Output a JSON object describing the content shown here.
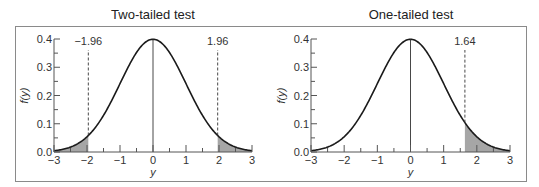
{
  "chart_data": [
    {
      "type": "area",
      "title": "Two-tailed test",
      "xlabel": "y",
      "ylabel": "f(y)",
      "xlim": [
        -3,
        3
      ],
      "ylim": [
        0,
        0.4
      ],
      "xticks": [
        -3,
        -2,
        -1,
        0,
        1,
        2,
        3
      ],
      "xtick_labels": [
        "−3",
        "−2",
        "−1",
        "0",
        "1",
        "2",
        "3"
      ],
      "yticks": [
        0.0,
        0.1,
        0.2,
        0.3,
        0.4
      ],
      "ytick_labels": [
        "0.0",
        "0.1",
        "0.2",
        "0.3",
        "0.4"
      ],
      "curve": "standard normal density",
      "critical_values": [
        -1.96,
        1.96
      ],
      "critical_labels": [
        "−1.96",
        "1.96"
      ],
      "shaded_regions": [
        [
          -3,
          -1.96
        ],
        [
          1.96,
          3
        ]
      ],
      "grid": false
    },
    {
      "type": "area",
      "title": "One-tailed test",
      "xlabel": "y",
      "ylabel": "f(y)",
      "xlim": [
        -3,
        3
      ],
      "ylim": [
        0,
        0.4
      ],
      "xticks": [
        -3,
        -2,
        -1,
        0,
        1,
        2,
        3
      ],
      "xtick_labels": [
        "−3",
        "−2",
        "−1",
        "0",
        "1",
        "2",
        "3"
      ],
      "yticks": [
        0.0,
        0.1,
        0.2,
        0.3,
        0.4
      ],
      "ytick_labels": [
        "0.0",
        "0.1",
        "0.2",
        "0.3",
        "0.4"
      ],
      "curve": "standard normal density",
      "critical_values": [
        1.64
      ],
      "critical_labels": [
        "1.64"
      ],
      "shaded_regions": [
        [
          1.64,
          3
        ]
      ],
      "grid": false
    }
  ],
  "colors": {
    "curve": "#1a1a1a",
    "shade": "#a6a6a6",
    "axis": "#555555",
    "frame": "#8a8a8a"
  }
}
